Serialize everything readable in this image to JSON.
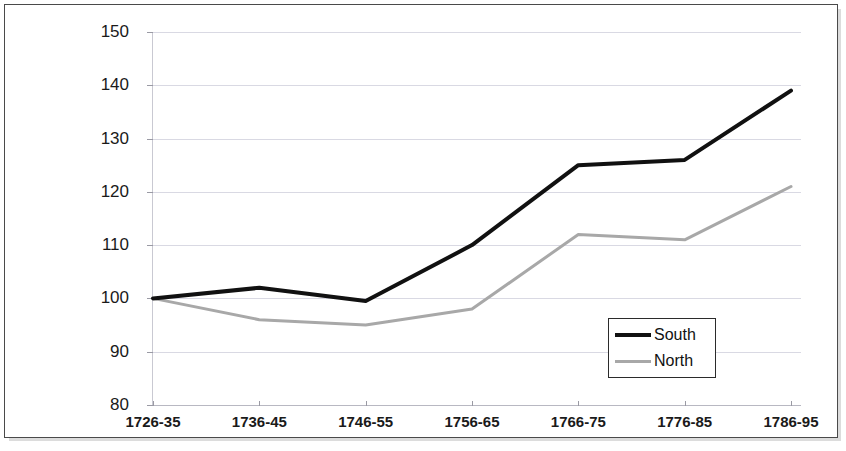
{
  "chart_data": {
    "type": "line",
    "title": "",
    "xlabel": "",
    "ylabel": "",
    "categories": [
      "1726-35",
      "1736-45",
      "1746-55",
      "1756-65",
      "1766-75",
      "1776-85",
      "1786-95"
    ],
    "ylim": [
      80,
      150
    ],
    "yticks": [
      80,
      90,
      100,
      110,
      120,
      130,
      140,
      150
    ],
    "grid": true,
    "legend_position": "inside-lower-right",
    "series": [
      {
        "name": "South",
        "color": "#111111",
        "line_width": 4,
        "values": [
          100,
          102,
          99.5,
          110,
          125,
          126,
          139
        ]
      },
      {
        "name": "North",
        "color": "#a8a8a8",
        "line_width": 3,
        "values": [
          100,
          96,
          95,
          98,
          112,
          111,
          121
        ]
      }
    ]
  },
  "axes": {
    "y_tick_labels": [
      "150",
      "140",
      "130",
      "120",
      "110",
      "100",
      "90",
      "80"
    ],
    "x_tick_labels": [
      "1726-35",
      "1736-45",
      "1746-55",
      "1756-65",
      "1766-75",
      "1776-85",
      "1786-95"
    ]
  },
  "legend": {
    "entries": [
      {
        "label": "South",
        "color": "#111111"
      },
      {
        "label": "North",
        "color": "#a8a8a8"
      }
    ]
  },
  "style": {
    "background": "#ffffff",
    "border_color": "#4a4a4a",
    "gridline_color": "#d9d9e3"
  }
}
